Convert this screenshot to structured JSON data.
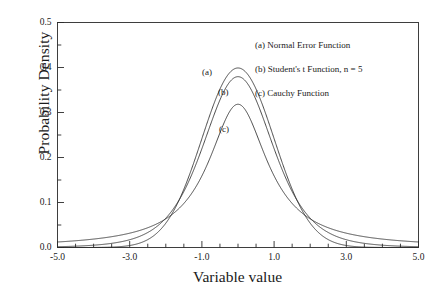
{
  "chart_data": {
    "type": "line",
    "title": "",
    "xlabel": "Variable value",
    "ylabel": "Probability Density",
    "xlim": [
      -5.0,
      5.0
    ],
    "ylim": [
      0.0,
      0.5
    ],
    "grid": false,
    "x_major_tick_step": 2.0,
    "x_minor_tick_step": 0.5,
    "y_major_tick_step": 0.1,
    "y_minor_tick_step": 0.05,
    "xticklabels": [
      "-5.0",
      "-3.0",
      "-1.0",
      "1.0",
      "3.0",
      "5.0"
    ],
    "xtickvalues": [
      -5.0,
      -3.0,
      -1.0,
      1.0,
      3.0,
      5.0
    ],
    "yticklabels": [
      "0.0",
      "0.1",
      "0.2",
      "0.3",
      "0.4",
      "0.5"
    ],
    "ytickvalues": [
      0.0,
      0.1,
      0.2,
      0.3,
      0.4,
      0.5
    ],
    "legend_position": "upper-right-inside",
    "series": [
      {
        "name": "(a) Normal Error Function",
        "tag": "(a)",
        "peak_value": 0.399,
        "peak_x": 0.0,
        "x": [
          -5.0,
          -4.75,
          -4.5,
          -4.25,
          -4.0,
          -3.75,
          -3.5,
          -3.25,
          -3.0,
          -2.75,
          -2.5,
          -2.25,
          -2.0,
          -1.75,
          -1.5,
          -1.25,
          -1.0,
          -0.75,
          -0.5,
          -0.25,
          0.0,
          0.25,
          0.5,
          0.75,
          1.0,
          1.25,
          1.5,
          1.75,
          2.0,
          2.25,
          2.5,
          2.75,
          3.0,
          3.25,
          3.5,
          3.75,
          4.0,
          4.25,
          4.5,
          4.75,
          5.0
        ],
        "values": [
          1.5e-06,
          4.9e-06,
          1.6e-05,
          4.65e-05,
          0.000134,
          0.000347,
          0.000873,
          0.002029,
          0.004432,
          0.009094,
          0.017528,
          0.03174,
          0.053991,
          0.086277,
          0.129518,
          0.182649,
          0.241971,
          0.301137,
          0.352065,
          0.386668,
          0.398942,
          0.386668,
          0.352065,
          0.301137,
          0.241971,
          0.182649,
          0.129518,
          0.086277,
          0.053991,
          0.03174,
          0.017528,
          0.009094,
          0.004432,
          0.002029,
          0.000873,
          0.000347,
          0.000134,
          4.65e-05,
          1.6e-05,
          4.9e-06,
          1.5e-06
        ]
      },
      {
        "name": "(b) Student's t Function, n = 5",
        "tag": "(b)",
        "peak_value": 0.38,
        "peak_x": 0.0,
        "x": [
          -5.0,
          -4.75,
          -4.5,
          -4.25,
          -4.0,
          -3.75,
          -3.5,
          -3.25,
          -3.0,
          -2.75,
          -2.5,
          -2.25,
          -2.0,
          -1.75,
          -1.5,
          -1.25,
          -1.0,
          -0.75,
          -0.5,
          -0.25,
          0.0,
          0.25,
          0.5,
          0.75,
          1.0,
          1.25,
          1.5,
          1.75,
          2.0,
          2.25,
          2.5,
          2.75,
          3.0,
          3.25,
          3.5,
          3.75,
          4.0,
          4.25,
          4.5,
          4.75,
          5.0
        ],
        "values": [
          0.0017,
          0.002108,
          0.002639,
          0.003338,
          0.004268,
          0.005519,
          0.007216,
          0.009541,
          0.012754,
          0.017216,
          0.023428,
          0.032087,
          0.044174,
          0.061057,
          0.084624,
          0.117212,
          0.16136,
          0.219338,
          0.291892,
          0.346155,
          0.379607,
          0.346155,
          0.291892,
          0.219338,
          0.16136,
          0.117212,
          0.084624,
          0.061057,
          0.044174,
          0.032087,
          0.023428,
          0.017216,
          0.012754,
          0.009541,
          0.007216,
          0.005519,
          0.004268,
          0.003338,
          0.002639,
          0.002108,
          0.0017
        ]
      },
      {
        "name": "(c) Cauchy Function",
        "tag": "(c)",
        "peak_value": 0.318,
        "peak_x": 0.0,
        "x": [
          -5.0,
          -4.75,
          -4.5,
          -4.25,
          -4.0,
          -3.75,
          -3.5,
          -3.25,
          -3.0,
          -2.75,
          -2.5,
          -2.25,
          -2.0,
          -1.75,
          -1.5,
          -1.25,
          -1.0,
          -0.75,
          -0.5,
          -0.25,
          0.0,
          0.25,
          0.5,
          0.75,
          1.0,
          1.25,
          1.5,
          1.75,
          2.0,
          2.25,
          2.5,
          2.75,
          3.0,
          3.25,
          3.5,
          3.75,
          4.0,
          4.25,
          4.5,
          4.75,
          5.0
        ],
        "values": [
          0.012242,
          0.013484,
          0.014921,
          0.016597,
          0.018724,
          0.020882,
          0.023779,
          0.027246,
          0.031831,
          0.036855,
          0.043859,
          0.052461,
          0.063662,
          0.078207,
          0.097947,
          0.124337,
          0.159155,
          0.203718,
          0.254648,
          0.299588,
          0.31831,
          0.299588,
          0.254648,
          0.203718,
          0.159155,
          0.124337,
          0.097947,
          0.078207,
          0.063662,
          0.052461,
          0.043859,
          0.036855,
          0.031831,
          0.027246,
          0.023779,
          0.020882,
          0.018724,
          0.016597,
          0.014921,
          0.013484,
          0.012242
        ]
      }
    ],
    "legend_entries": [
      "(a) Normal Error Function",
      "(b) Student's t Function, n = 5",
      "(c) Cauchy Function"
    ],
    "inline_tags": [
      "(a)",
      "(b)",
      "(c)"
    ],
    "colors": {
      "axis": "#2b2b2b",
      "curve": "#2b2b2b",
      "background": "#ffffff"
    }
  }
}
